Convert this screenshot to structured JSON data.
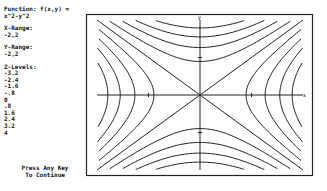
{
  "sidebar": {
    "function_label": "Function: f(x,y) =",
    "function_expr": "x^2-y^2",
    "x_range_label": "X-Range:",
    "x_range_value": "-2,2",
    "y_range_label": "Y-Range:",
    "y_range_value": "-2,2",
    "z_levels_label": "Z-Levels:",
    "z_levels": [
      "-3.2",
      "-2.4",
      "-1.6",
      "-.8",
      "0",
      ".8",
      "1.6",
      "2.4",
      "3.2",
      "4"
    ],
    "prompt_line1": "Press Any Key",
    "prompt_line2": "To Continue"
  },
  "axes": {
    "x_label": "x",
    "y_label": "y"
  },
  "chart_data": {
    "type": "contour",
    "title": "Function: f(x,y) = x^2-y^2",
    "function": "x^2-y^2",
    "x_range": [
      -2,
      2
    ],
    "y_range": [
      -2,
      2
    ],
    "levels": [
      -3.2,
      -2.4,
      -1.6,
      -0.8,
      0,
      0.8,
      1.6,
      2.4,
      3.2,
      4
    ],
    "xlabel": "x",
    "ylabel": "y",
    "grid": false
  }
}
